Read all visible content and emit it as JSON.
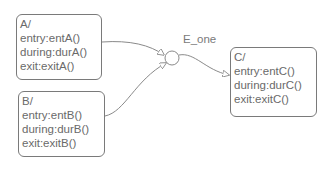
{
  "diagram": {
    "type": "stateflow-chart",
    "states": [
      {
        "id": "A",
        "name": "A/",
        "actions": [
          "entry:entA()",
          "during:durA()",
          "exit:exitA()"
        ]
      },
      {
        "id": "B",
        "name": "B/",
        "actions": [
          "entry:entB()",
          "during:durB()",
          "exit:exitB()"
        ]
      },
      {
        "id": "C",
        "name": "C/",
        "actions": [
          "entry:entC()",
          "during:durC()",
          "exit:exitC()"
        ]
      }
    ],
    "junction": {
      "type": "connective-junction"
    },
    "transitions": [
      {
        "from": "A",
        "to": "junction",
        "label": ""
      },
      {
        "from": "B",
        "to": "junction",
        "label": ""
      },
      {
        "from": "junction",
        "to": "C",
        "label": "E_one"
      }
    ],
    "colors": {
      "stroke": "#7a7a7a",
      "text": "#6a6a6a",
      "background": "#ffffff"
    }
  }
}
